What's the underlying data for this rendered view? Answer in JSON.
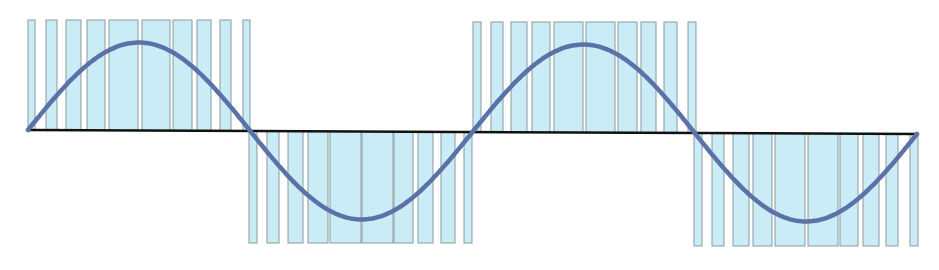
{
  "diagram": {
    "type": "pwm-sine-modulation",
    "colors": {
      "background": "#ffffff",
      "pulse_fill": "#c9ecf7",
      "pulse_stroke": "#8a9a9c",
      "sine": "#5a72a8",
      "axis": "#111111"
    },
    "axis": {
      "x1": 28,
      "x2": 918,
      "y1": 130,
      "y2": 134
    },
    "sine": {
      "x_start": 28,
      "x_end": 917,
      "amplitude": 88,
      "cycles": 2
    },
    "pulse_groups": [
      {
        "polarity": "positive",
        "top": 20,
        "pulses": [
          [
            28,
            35
          ],
          [
            46,
            57
          ],
          [
            66,
            81
          ],
          [
            87,
            105
          ],
          [
            109,
            138
          ],
          [
            142,
            170
          ],
          [
            173,
            192
          ],
          [
            197,
            211
          ],
          [
            220,
            231
          ],
          [
            243,
            250
          ]
        ]
      },
      {
        "polarity": "negative",
        "bottom": 243,
        "pulses": [
          [
            249,
            257
          ],
          [
            267,
            279
          ],
          [
            288,
            303
          ],
          [
            308,
            328
          ],
          [
            330,
            361
          ],
          [
            362,
            393
          ],
          [
            394,
            413
          ],
          [
            418,
            433
          ],
          [
            441,
            455
          ],
          [
            464,
            472
          ]
        ]
      },
      {
        "polarity": "positive",
        "top": 22,
        "pulses": [
          [
            473,
            481
          ],
          [
            491,
            503
          ],
          [
            511,
            527
          ],
          [
            532,
            550
          ],
          [
            554,
            583
          ],
          [
            586,
            615
          ],
          [
            618,
            637
          ],
          [
            641,
            656
          ],
          [
            664,
            677
          ],
          [
            688,
            696
          ]
        ]
      },
      {
        "polarity": "negative",
        "bottom": 246,
        "pulses": [
          [
            694,
            702
          ],
          [
            712,
            724
          ],
          [
            733,
            749
          ],
          [
            753,
            772
          ],
          [
            775,
            805
          ],
          [
            808,
            838
          ],
          [
            840,
            858
          ],
          [
            863,
            879
          ],
          [
            886,
            898
          ],
          [
            910,
            918
          ]
        ]
      }
    ]
  }
}
